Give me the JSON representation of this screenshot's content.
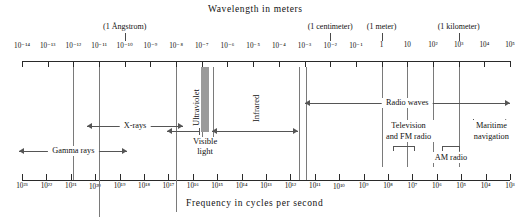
{
  "figure": {
    "top_title": "Wavelength in meters",
    "bottom_title": "Frequency in cycles per second"
  },
  "chart_data": {
    "type": "diagram",
    "title": "Wavelength in meters",
    "xlabel": "Frequency in cycles per second",
    "top_axis": {
      "label": "Wavelength in meters",
      "unit": "meters",
      "exponent_min": -14,
      "exponent_max": 5,
      "tick_labels": [
        "10⁻¹⁴",
        "10⁻¹³",
        "10⁻¹²",
        "10⁻¹¹",
        "10⁻¹⁰",
        "10⁻⁹",
        "10⁻⁸",
        "10⁻⁷",
        "10⁻⁶",
        "10⁻⁵",
        "10⁻⁴",
        "10⁻³",
        "10⁻²",
        "10⁻¹",
        "1",
        "10",
        "10²",
        "10³",
        "10⁴",
        "10⁵"
      ]
    },
    "bottom_axis": {
      "label": "Frequency in cycles per second",
      "unit": "hertz",
      "exponent_min": 3,
      "exponent_max": 23,
      "tick_labels": [
        "10²³",
        "10²²",
        "10²¹",
        "10²⁰",
        "10¹⁹",
        "10¹⁸",
        "10¹⁷",
        "10¹⁶",
        "10¹⁵",
        "10¹⁴",
        "10¹³",
        "10¹²",
        "10¹¹",
        "10¹⁰",
        "10⁹",
        "10⁸",
        "10⁷",
        "10⁶",
        "10⁵",
        "10⁴",
        "10³"
      ]
    },
    "callouts": [
      {
        "text": "(1 Ångstrom)",
        "wavelength_exponent": -10
      },
      {
        "text": "(1 centimeter)",
        "wavelength_exponent": -2
      },
      {
        "text": "(1 meter)",
        "wavelength_exponent": 0
      },
      {
        "text": "(1 kilometer)",
        "wavelength_exponent": 3
      }
    ],
    "bands": [
      {
        "name": "Gamma rays",
        "from_exponent": -14,
        "to_exponent": -11
      },
      {
        "name": "X-rays",
        "from_exponent": -12,
        "to_exponent": -8
      },
      {
        "name": "Ultraviolet",
        "from_exponent": -8,
        "to_exponent": -7
      },
      {
        "name": "Visible light",
        "from_exponent": -7,
        "to_exponent": -6.6
      },
      {
        "name": "Infrared",
        "from_exponent": -6.5,
        "to_exponent": -3.5
      },
      {
        "name": "Radio waves",
        "from_exponent": -3,
        "to_exponent": 5
      },
      {
        "name": "Television and FM radio",
        "from_exponent": 0,
        "to_exponent": 1
      },
      {
        "name": "AM radio",
        "from_exponent": 2,
        "to_exponent": 3
      },
      {
        "name": "Maritime navigation",
        "from_exponent": 3.6,
        "to_exponent": 5
      }
    ]
  },
  "labels": {
    "gamma_rays": "Gamma rays",
    "x_rays": "X-rays",
    "ultraviolet": "Ultraviolet",
    "visible_light_line1": "Visible",
    "visible_light_line2": "light",
    "infrared": "Infrared",
    "radio_waves": "Radio waves",
    "television_line1": "Television",
    "television_line2": "and FM radio",
    "am_radio": "AM radio",
    "maritime_line1": "Maritime",
    "maritime_line2": "navigation"
  },
  "callout_labels": {
    "angstrom": "(1 Ångstrom)",
    "centimeter": "(1 centimeter)",
    "meter": "(1 meter)",
    "kilometer": "(1 kilometer)"
  },
  "colors": {
    "ink": "#1a1a1a",
    "rule": "#555555",
    "visible_band": "#9a9a9a",
    "background": "#ffffff"
  }
}
